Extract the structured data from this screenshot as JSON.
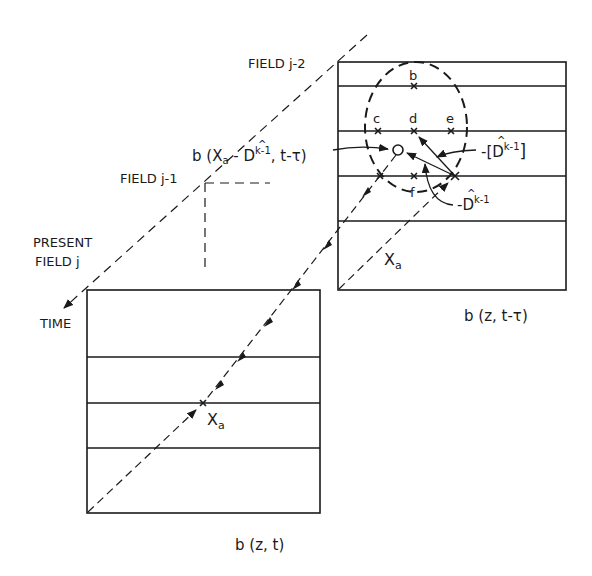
{
  "labels": {
    "field_j2": "FIELD j-2",
    "field_j1": "FIELD j-1",
    "present_line1": "PRESENT",
    "present_line2": "FIELD j",
    "time": "TIME",
    "b_displaced_prefix": "b (X",
    "b_displaced_sub": "a",
    "b_displaced_mid": " - D",
    "b_displaced_sup": "k-1",
    "b_displaced_suffix": ", t-τ)",
    "neg_bracket_prefix": "-[D",
    "neg_bracket_sup": "k-1",
    "neg_bracket_suffix": "]",
    "neg_d_prefix": "-D",
    "neg_d_sup": "k-1",
    "xa_upper": "X",
    "xa_upper_sub": "a",
    "xa_lower": "X",
    "xa_lower_sub": "a",
    "upper_box_caption": "b (z, t-τ)",
    "lower_box_caption": "b (z, t)",
    "hat": "^"
  },
  "points": {
    "b": "b",
    "c": "c",
    "d": "d",
    "e": "e",
    "f": "f",
    "o": "O"
  },
  "colors": {
    "ink": "#1a1a1a",
    "background": "#ffffff"
  }
}
